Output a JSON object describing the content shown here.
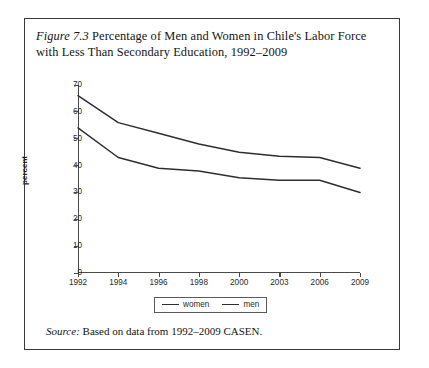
{
  "figure": {
    "label": "Figure 7.3",
    "caption_text": " Percentage of Men and Women in Chile's Labor Force with Less Than Secondary Education, 1992–2009",
    "source_label": "Source:",
    "source_text": " Based on data from 1992–2009 CASEN."
  },
  "legend": {
    "position": "bottom-center",
    "items": [
      {
        "label": "women",
        "color": "#2e2e2e"
      },
      {
        "label": "men",
        "color": "#2e2e2e"
      }
    ]
  },
  "chart_data": {
    "type": "line",
    "title": "Figure 7.3 Percentage of Men and Women in Chile's Labor Force with Less Than Secondary Education, 1992–2009",
    "xlabel": "",
    "ylabel": "percent",
    "categories": [
      "1992",
      "1994",
      "1996",
      "1998",
      "2000",
      "2003",
      "2006",
      "2009"
    ],
    "series": [
      {
        "name": "men",
        "values": [
          66,
          56,
          52,
          48,
          45,
          43.5,
          43,
          39
        ]
      },
      {
        "name": "women",
        "values": [
          54,
          43,
          39,
          38,
          35.5,
          34.5,
          34.5,
          30
        ]
      }
    ],
    "ylim": [
      0,
      70
    ],
    "yticks": [
      0,
      10,
      20,
      30,
      40,
      50,
      60,
      70
    ],
    "grid": false,
    "legend_entries": [
      "women",
      "men"
    ],
    "line_color": "#2e2e2e",
    "axis_color": "#4a4a4a",
    "source": "Based on data from 1992–2009 CASEN."
  }
}
